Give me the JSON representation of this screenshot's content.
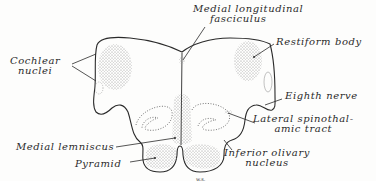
{
  "diagram": {
    "colors": {
      "ink": "#2a2a2a",
      "stipple": "#8a8a8a",
      "background": "#fdfdfc"
    },
    "labels": [
      {
        "id": "cochlear",
        "line1": "Cochlear",
        "line2": "nuclei"
      },
      {
        "id": "mlf",
        "line1": "Medial longitudinal",
        "line2": "fasciculus"
      },
      {
        "id": "restiform",
        "line1": "Restiform body"
      },
      {
        "id": "eighth",
        "line1": "Eighth nerve"
      },
      {
        "id": "lst",
        "line1": "Lateral spinothal-",
        "line2": "amic tract"
      },
      {
        "id": "ml",
        "line1": "Medial lemniscus"
      },
      {
        "id": "pyramid",
        "line1": "Pyramid"
      },
      {
        "id": "ion",
        "line1": "Inferior olivary",
        "line2": "nucleus"
      }
    ],
    "signature": "w.s."
  }
}
